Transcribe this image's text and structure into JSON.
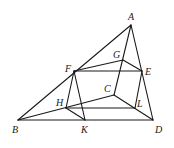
{
  "diagram": {
    "type": "geometry",
    "stroke_color": "#1a1a1a",
    "points": {
      "A": {
        "x": 131,
        "y": 25,
        "label": "A",
        "lx": 128,
        "ly": 20
      },
      "B": {
        "x": 18,
        "y": 120,
        "label": "B",
        "lx": 12,
        "ly": 133
      },
      "C": {
        "x": 114,
        "y": 95,
        "label": "C",
        "lx": 104,
        "ly": 92
      },
      "D": {
        "x": 153,
        "y": 120,
        "label": "D",
        "lx": 155,
        "ly": 133
      },
      "E": {
        "x": 142,
        "y": 71,
        "label": "E",
        "lx": 145,
        "ly": 75
      },
      "F": {
        "x": 74,
        "y": 71,
        "label": "F",
        "lx": 65,
        "ly": 72
      },
      "G": {
        "x": 123,
        "y": 60,
        "label": "G",
        "lx": 113,
        "ly": 58
      },
      "H": {
        "x": 66,
        "y": 108,
        "label": "H",
        "lx": 56,
        "ly": 106
      },
      "K": {
        "x": 85,
        "y": 120,
        "label": "K",
        "lx": 81,
        "ly": 133
      },
      "L": {
        "x": 135,
        "y": 108,
        "label": "L",
        "lx": 137,
        "ly": 107
      }
    },
    "edges": [
      [
        "A",
        "B"
      ],
      [
        "A",
        "D"
      ],
      [
        "B",
        "D"
      ],
      [
        "A",
        "C"
      ],
      [
        "B",
        "C"
      ],
      [
        "C",
        "D"
      ],
      [
        "F",
        "E"
      ],
      [
        "F",
        "G"
      ],
      [
        "G",
        "E"
      ],
      [
        "F",
        "H"
      ],
      [
        "F",
        "K"
      ],
      [
        "H",
        "K"
      ],
      [
        "H",
        "L"
      ],
      [
        "E",
        "L"
      ]
    ]
  }
}
